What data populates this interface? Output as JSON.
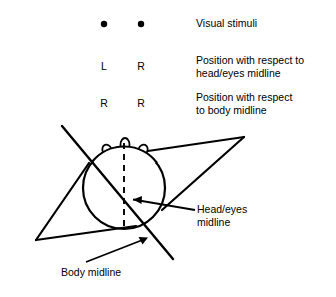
{
  "figure": {
    "background_color": "#ffffff",
    "stroke_color": "#000000"
  },
  "stimuli": {
    "row_label": "Visual stimuli",
    "dots": [
      {
        "name": "left-stimulus-dot",
        "cx": 104,
        "cy": 24,
        "r": 3.2
      },
      {
        "name": "right-stimulus-dot",
        "cx": 141,
        "cy": 24,
        "r": 3.2
      }
    ]
  },
  "rows": [
    {
      "id": "visual-stimuli",
      "description": "Visual stimuli",
      "values": []
    },
    {
      "id": "head-eyes-midline-position",
      "description": "Position with respect to\nhead/eyes midline",
      "description_line1": "Position with respect to",
      "description_line2": "head/eyes midline",
      "values": [
        "L",
        "R"
      ]
    },
    {
      "id": "body-midline-position",
      "description": "Position with respect\nto body midline",
      "description_line1": "Position with respect",
      "description_line2": "to body midline",
      "values": [
        "R",
        "R"
      ]
    }
  ],
  "callouts": [
    {
      "id": "head-eyes-midline",
      "line1": "Head/eyes",
      "line2": "midline",
      "leader": {
        "x1": 195,
        "y1": 210,
        "x2": 131,
        "y2": 199
      }
    },
    {
      "id": "body-midline",
      "line1": "Body midline",
      "line2": "",
      "leader": {
        "x1": 86,
        "y1": 262,
        "x2": 146,
        "y2": 238
      }
    }
  ],
  "diagram": {
    "head": {
      "name": "head-circle",
      "cx": 124,
      "cy": 188,
      "r": 41
    },
    "features": [
      {
        "name": "left-eye-bump",
        "cx": 107,
        "cy": 150,
        "rx": 4.5,
        "ry": 5.5,
        "rot": -22
      },
      {
        "name": "nose-bump",
        "cx": 125,
        "cy": 145,
        "rx": 4.5,
        "ry": 7.0,
        "rot": 0
      },
      {
        "name": "right-eye-bump",
        "cx": 143,
        "cy": 150,
        "rx": 4.5,
        "ry": 5.5,
        "rot": 22
      }
    ],
    "head_eyes_midline": {
      "name": "head-eyes-midline-dashed",
      "x": 124,
      "y1": 143,
      "y2": 231,
      "dash": "6 5"
    },
    "body_midline": {
      "name": "body-midline-diagonal",
      "x1": 62,
      "y1": 126,
      "x2": 173,
      "y2": 259
    },
    "body_left_wing": {
      "name": "body-left-shoulder",
      "tip_x": 36,
      "tip_y": 240,
      "a_x": 89,
      "a_y": 163,
      "b_x": 136,
      "b_y": 226
    },
    "body_right_wing": {
      "name": "body-right-shoulder",
      "tip_x": 244,
      "tip_y": 137,
      "a_x": 141,
      "a_y": 152,
      "b_x": 162,
      "b_y": 210
    }
  }
}
